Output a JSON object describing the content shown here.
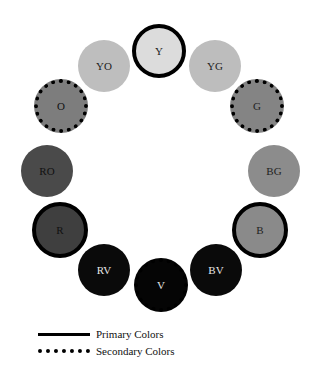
{
  "diagram": {
    "type": "color-wheel",
    "swatches": [
      {
        "label": "Y",
        "name": "yellow",
        "kind": "primary",
        "fill": "#dcdcdc",
        "text_color": "#222222",
        "cx": 159,
        "cy": 51,
        "r": 27
      },
      {
        "label": "YG",
        "name": "yellow-green",
        "kind": "tertiary",
        "fill": "#bdbdbd",
        "text_color": "#222222",
        "cx": 215,
        "cy": 66,
        "r": 26
      },
      {
        "label": "G",
        "name": "green",
        "kind": "secondary",
        "fill": "#848484",
        "text_color": "#222222",
        "cx": 257,
        "cy": 106,
        "r": 27
      },
      {
        "label": "BG",
        "name": "blue-green",
        "kind": "tertiary",
        "fill": "#8c8c8c",
        "text_color": "#222222",
        "cx": 274,
        "cy": 171,
        "r": 26
      },
      {
        "label": "B",
        "name": "blue",
        "kind": "primary",
        "fill": "#8a8a8a",
        "text_color": "#222222",
        "cx": 260,
        "cy": 230,
        "r": 28
      },
      {
        "label": "BV",
        "name": "blue-violet",
        "kind": "tertiary",
        "fill": "#0a0a0a",
        "text_color": "#e6e6e6",
        "cx": 216,
        "cy": 270,
        "r": 26
      },
      {
        "label": "V",
        "name": "violet",
        "kind": "secondary",
        "fill": "#050505",
        "text_color": "#e6e6e6",
        "cx": 161,
        "cy": 285,
        "r": 27
      },
      {
        "label": "RV",
        "name": "red-violet",
        "kind": "tertiary",
        "fill": "#0a0a0a",
        "text_color": "#e6e6e6",
        "cx": 104,
        "cy": 270,
        "r": 26
      },
      {
        "label": "R",
        "name": "red",
        "kind": "primary",
        "fill": "#3f3f3f",
        "text_color": "#111111",
        "cx": 60,
        "cy": 230,
        "r": 28
      },
      {
        "label": "RO",
        "name": "red-orange",
        "kind": "tertiary",
        "fill": "#4a4a4a",
        "text_color": "#111111",
        "cx": 47,
        "cy": 171,
        "r": 26
      },
      {
        "label": "O",
        "name": "orange",
        "kind": "secondary",
        "fill": "#7d7d7d",
        "text_color": "#111111",
        "cx": 61,
        "cy": 106,
        "r": 27
      },
      {
        "label": "YO",
        "name": "yellow-orange",
        "kind": "tertiary",
        "fill": "#bebebe",
        "text_color": "#222222",
        "cx": 104,
        "cy": 66,
        "r": 26
      }
    ]
  },
  "legend": {
    "primary_label": "Primary Colors",
    "secondary_label": "Secondary Colors"
  }
}
